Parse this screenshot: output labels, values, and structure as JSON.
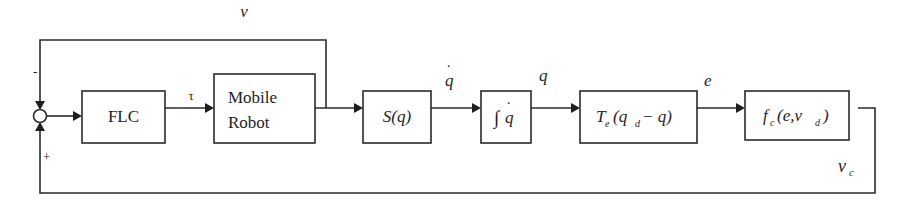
{
  "diagram": {
    "type": "control-loop block diagram",
    "blocks": {
      "flc": {
        "label": "FLC"
      },
      "robot": {
        "line1": "Mobile",
        "line2": "Robot"
      },
      "s": {
        "label": "S(q)"
      },
      "integral": {
        "symbol": "∫",
        "arg": "q",
        "dot": "˙"
      },
      "transform": {
        "T": "T",
        "T_sub": "e",
        "open": "(q",
        "qd_sub": "d",
        "rest": " − q)"
      },
      "fc": {
        "f": "f",
        "f_sub": "c",
        "open": "(e,v",
        "vd_sub": "d",
        "close": ")"
      }
    },
    "signals": {
      "tau": "τ",
      "v": "v",
      "qdot": "q",
      "qdot_dot": "˙",
      "q": "q",
      "e": "e",
      "vc": "v",
      "vc_sub": "c"
    },
    "summing_junction": {
      "top_sign": "-",
      "bottom_sign": "+"
    }
  }
}
